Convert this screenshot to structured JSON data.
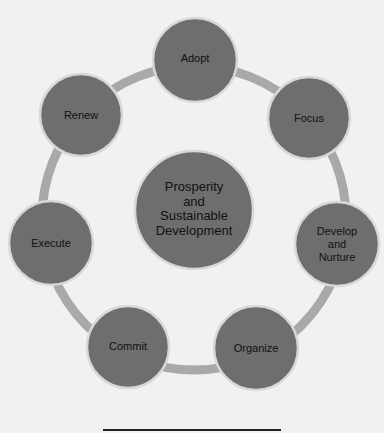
{
  "diagram": {
    "center": {
      "label": "Prosperity and Sustainable Development",
      "lines": [
        "Prosperity",
        "and",
        "Sustainable",
        "Development"
      ]
    },
    "nodes": [
      {
        "id": "adopt",
        "label": "Adopt"
      },
      {
        "id": "focus",
        "label": "Focus"
      },
      {
        "id": "develop",
        "label": "Develop and Nurture",
        "lines": [
          "Develop",
          "and",
          "Nurture"
        ]
      },
      {
        "id": "organize",
        "label": "Organize"
      },
      {
        "id": "commit",
        "label": "Commit"
      },
      {
        "id": "execute",
        "label": "Execute"
      },
      {
        "id": "renew",
        "label": "Renew"
      }
    ],
    "colors": {
      "node_fill": "#6e6e6e",
      "ring": "#a9a9a9",
      "node_border": "#ffffff",
      "background": "#f1f1ef"
    }
  }
}
